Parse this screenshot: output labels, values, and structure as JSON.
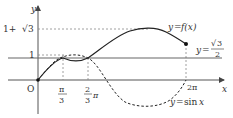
{
  "diagram": {
    "type": "function-graph",
    "axes": {
      "x_label": "x",
      "y_label": "y",
      "origin_label": "O"
    },
    "y_ticks": [
      {
        "label": "1+√3",
        "label_a": "1+",
        "label_b": "3"
      },
      {
        "label": "1"
      }
    ],
    "x_ticks": [
      {
        "label": "π/3",
        "num": "π",
        "den": "3"
      },
      {
        "label": "2/3π",
        "num": "2",
        "den": "3",
        "suffix": "π"
      },
      {
        "label": "2π"
      }
    ],
    "curves": [
      {
        "name": "f",
        "label": "y=f(x)",
        "style": "solid"
      },
      {
        "name": "sin",
        "label": "y=sin x",
        "style": "dashed"
      },
      {
        "name": "const",
        "label": "y=√3/2",
        "style": "solid"
      }
    ],
    "labels": {
      "f_prefix": "y",
      "f_eq": "=",
      "f_func": "f(x)",
      "sin_prefix": "y",
      "sin_eq": "=",
      "sin_func": "sin",
      "sin_var": "x",
      "const_prefix": "y",
      "const_eq": "=",
      "const_num": "3",
      "const_den": "2"
    },
    "colors": {
      "curve": "#222222",
      "axis": "#555555",
      "guide": "#888888"
    }
  }
}
